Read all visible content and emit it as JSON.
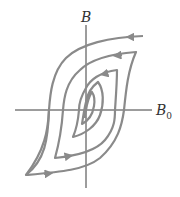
{
  "diagram": {
    "type": "hysteresis-loops",
    "y_axis_label": "B",
    "x_axis_label": "B",
    "x_axis_subscript": "0",
    "loop_count": 5,
    "colors": {
      "axis": "#3a3a3a",
      "loop": "#8a8a8a"
    }
  }
}
